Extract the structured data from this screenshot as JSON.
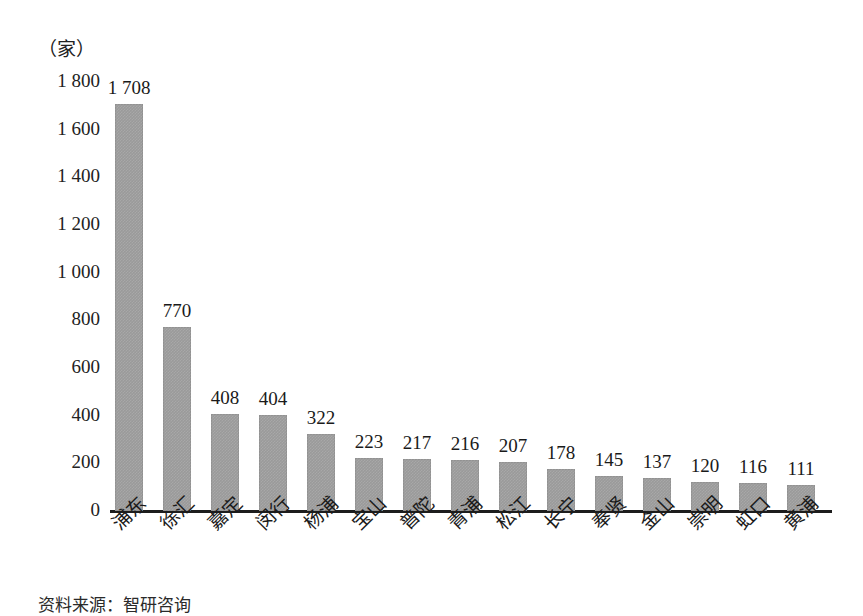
{
  "chart_data": {
    "type": "bar",
    "title": "",
    "subtitle": "",
    "xlabel": "",
    "ylabel": "（家）",
    "unit_caption": "（家）",
    "ylim": [
      0,
      1800
    ],
    "ytick_step": 200,
    "grid": false,
    "legend": null,
    "orientation": "vertical",
    "bar_color": "#9a9a9a",
    "axis_color": "#1d1d1d",
    "text_color": "#1a1a1a",
    "categories": [
      "浦东",
      "徐汇",
      "嘉定",
      "闵行",
      "杨浦",
      "宝山",
      "普陀",
      "青浦",
      "松江",
      "长宁",
      "奉贤",
      "金山",
      "崇明",
      "虹口",
      "黄浦"
    ],
    "values": [
      1708,
      770,
      408,
      404,
      322,
      223,
      217,
      216,
      207,
      178,
      145,
      137,
      120,
      116,
      111
    ],
    "value_labels": [
      "1 708",
      "770",
      "408",
      "404",
      "322",
      "223",
      "217",
      "216",
      "207",
      "178",
      "145",
      "137",
      "120",
      "116",
      "111"
    ],
    "ytick_labels": [
      "1 800",
      "1 600",
      "1 400",
      "1 200",
      "1 000",
      "800",
      "600",
      "400",
      "200",
      "0"
    ],
    "ytick_values": [
      1800,
      1600,
      1400,
      1200,
      1000,
      800,
      600,
      400,
      200,
      0
    ],
    "annotations": []
  },
  "footer": {
    "source_note": "资料来源：智研咨询"
  }
}
